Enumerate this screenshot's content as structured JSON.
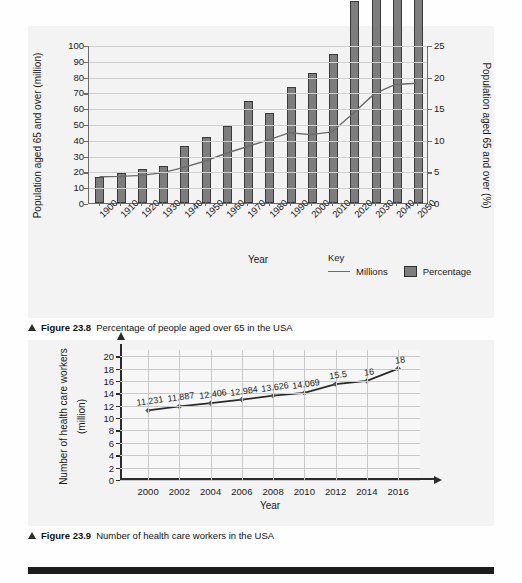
{
  "figures": [
    {
      "caption_prefix": "Figure 23.8",
      "caption_text": "Percentage of people aged over 65 in the USA",
      "key_label": "Key",
      "key_line": "Millions",
      "key_bar": "Percentage"
    },
    {
      "caption_prefix": "Figure 23.9",
      "caption_text": "Number of health care workers in the USA"
    }
  ],
  "chart_data": [
    {
      "type": "bar",
      "title": "Percentage of people aged over 65 in the USA",
      "xlabel": "Year",
      "ylabel": "Population aged 65 and over (million)",
      "y2label": "Population aged 65 and over (%)",
      "categories": [
        "1900",
        "1910",
        "1920",
        "1930",
        "1940",
        "1950",
        "1960",
        "1970",
        "1980",
        "1990",
        "2000",
        "2010",
        "2020",
        "2030",
        "2040",
        "2050"
      ],
      "yticks": [
        0,
        10,
        20,
        30,
        40,
        50,
        60,
        70,
        80,
        90,
        100
      ],
      "y2ticks": [
        0,
        5,
        10,
        15,
        20,
        25
      ],
      "ylim": [
        0,
        100
      ],
      "y2lim": [
        0,
        25
      ],
      "grid": true,
      "legend_position": "bottom-right",
      "series": [
        {
          "name": "Percentage",
          "axis": "right",
          "render": "bar",
          "color": "#7d7d7d",
          "values": [
            4.1,
            4.7,
            5.4,
            5.8,
            9.0,
            10.4,
            12.2,
            16.2,
            14.3,
            18.3,
            20.6,
            23.6,
            31.9,
            41.5,
            46.3,
            51.1
          ]
        },
        {
          "name": "Millions",
          "axis": "left",
          "render": "line",
          "color": "#6b6b6b",
          "values": [
            16.8,
            17.0,
            17.6,
            19.4,
            22.7,
            26.8,
            31.7,
            36.0,
            40.2,
            44.8,
            43.6,
            45.3,
            57.0,
            69.5,
            75.5,
            76.3
          ]
        }
      ]
    },
    {
      "type": "line",
      "title": "Number of health care workers in the USA",
      "xlabel": "Year",
      "ylabel": "Number of health care workers (million)",
      "categories": [
        "2000",
        "2002",
        "2004",
        "2006",
        "2008",
        "2010",
        "2012",
        "2014",
        "2016"
      ],
      "yticks": [
        0,
        2,
        4,
        6,
        8,
        10,
        12,
        14,
        16,
        18,
        20
      ],
      "ylim": [
        0,
        21
      ],
      "grid": true,
      "marker": "diamond",
      "color": "#2b2b2b",
      "values": [
        11.231,
        11.887,
        12.406,
        12.984,
        13.626,
        14.069,
        15.5,
        16,
        18
      ],
      "data_labels": [
        "11.231",
        "11.887",
        "12.406",
        "12.984",
        "13.626",
        "14.069",
        "15.5",
        "16",
        "18"
      ]
    }
  ]
}
